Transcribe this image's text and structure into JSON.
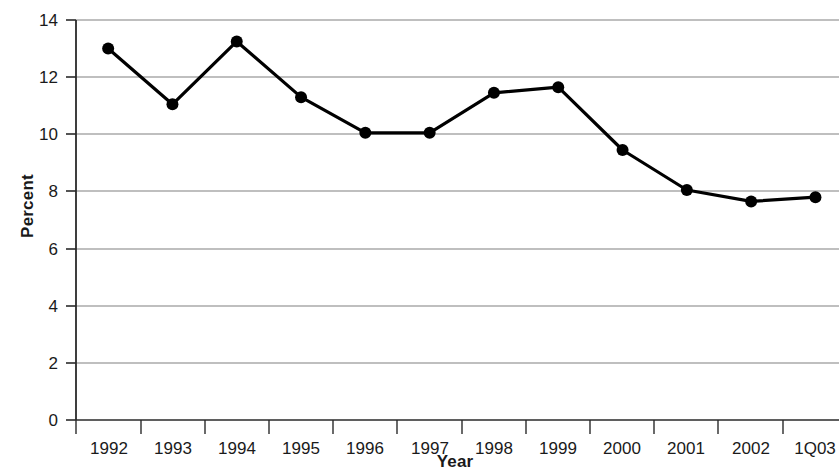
{
  "chart_data": {
    "type": "line",
    "title": "",
    "subtitle": "",
    "xlabel": "Year",
    "ylabel": "Percent",
    "categories": [
      "1992",
      "1993",
      "1994",
      "1995",
      "1996",
      "1997",
      "1998",
      "1999",
      "2000",
      "2001",
      "2002",
      "1Q03"
    ],
    "values": [
      13.0,
      11.05,
      13.25,
      11.3,
      10.05,
      10.05,
      11.45,
      11.65,
      9.45,
      8.05,
      7.65,
      7.8
    ],
    "series": [
      {
        "name": "Percent",
        "values": [
          13.0,
          11.05,
          13.25,
          11.3,
          10.05,
          10.05,
          11.45,
          11.65,
          9.45,
          8.05,
          7.65,
          7.8
        ]
      }
    ],
    "ylim": [
      0,
      14
    ],
    "ytick_values": [
      0,
      2,
      4,
      6,
      8,
      10,
      12,
      14
    ],
    "ytick_labels": [
      "0",
      "2",
      "4",
      "6",
      "8",
      "10",
      "12",
      "14"
    ],
    "xtick_labels": [
      "1992",
      "1993",
      "1994",
      "1995",
      "1996",
      "1997",
      "1998",
      "1999",
      "2000",
      "2001",
      "2002",
      "1Q03"
    ],
    "grid": "horizontal",
    "legend": "none",
    "marker": "filled-circle",
    "line_color": "#000000",
    "marker_color": "#000000",
    "grid_color": "#808080",
    "axis_color": "#000000",
    "background_color": "#ffffff",
    "annotations": []
  }
}
